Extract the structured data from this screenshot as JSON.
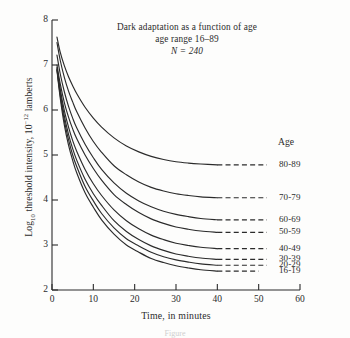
{
  "figure": {
    "background_color": "#fdfdfc",
    "ink_color": "#2b2b2b",
    "caption": "Figure"
  },
  "chart_data": {
    "type": "line",
    "title": "Dark adaptation as a function of age",
    "subtitle": "age range 16–89",
    "sample_note": "N = 240",
    "sample_size": 240,
    "xlabel": "Time, in minutes",
    "ylabel": "Log10 threshold intensity, 10-12 lamberts",
    "ylabel_parts": {
      "prefix": "Log",
      "sub": "10",
      "middle": " threshold intensity, 10",
      "sup": "−12",
      "suffix": " lamberts"
    },
    "xlim": [
      0,
      60
    ],
    "ylim": [
      2,
      8
    ],
    "xticks": [
      0,
      10,
      20,
      30,
      40,
      50,
      60
    ],
    "xtick_labels": [
      "0",
      "10",
      "20",
      "30",
      "40",
      "50",
      "60"
    ],
    "yticks": [
      2,
      3,
      4,
      5,
      6,
      7,
      8
    ],
    "ytick_labels": [
      "2",
      "3",
      "4",
      "5",
      "6",
      "7",
      "8"
    ],
    "grid": false,
    "legend_position": "right-inline",
    "legend_title": "Age",
    "series": [
      {
        "name": "80-89",
        "label": "80-89",
        "asymptote": 4.78,
        "start_value": 7.62,
        "x": [
          1.2,
          2,
          3,
          4,
          5,
          6,
          8,
          10,
          12,
          15,
          18,
          21,
          24,
          27,
          30,
          33,
          36,
          40
        ],
        "values": [
          7.62,
          7.28,
          6.98,
          6.74,
          6.54,
          6.36,
          6.06,
          5.82,
          5.62,
          5.38,
          5.2,
          5.07,
          4.97,
          4.9,
          4.85,
          4.82,
          4.8,
          4.78
        ],
        "dash_x": [
          40,
          52
        ],
        "dash_y": 4.78
      },
      {
        "name": "70-79",
        "label": "70-79",
        "asymptote": 4.05,
        "start_value": 7.5,
        "x": [
          1.2,
          2,
          3,
          4,
          5,
          6,
          8,
          10,
          12,
          15,
          18,
          21,
          24,
          27,
          30,
          33,
          36,
          40
        ],
        "values": [
          7.5,
          7.1,
          6.72,
          6.42,
          6.18,
          5.96,
          5.6,
          5.3,
          5.06,
          4.76,
          4.56,
          4.4,
          4.28,
          4.2,
          4.14,
          4.1,
          4.07,
          4.05
        ],
        "dash_x": [
          40,
          52
        ],
        "dash_y": 4.05
      },
      {
        "name": "60-69",
        "label": "60-69",
        "asymptote": 3.56,
        "start_value": 7.22,
        "x": [
          1.2,
          2,
          3,
          4,
          5,
          6,
          8,
          10,
          12,
          15,
          18,
          21,
          24,
          27,
          30,
          33,
          36,
          40
        ],
        "values": [
          7.22,
          6.8,
          6.4,
          6.08,
          5.82,
          5.6,
          5.24,
          4.94,
          4.68,
          4.38,
          4.15,
          3.98,
          3.85,
          3.75,
          3.68,
          3.63,
          3.59,
          3.56
        ],
        "dash_x": [
          40,
          52
        ],
        "dash_y": 3.56
      },
      {
        "name": "50-59",
        "label": "50-59",
        "asymptote": 3.28,
        "start_value": 7.0,
        "x": [
          1.2,
          2,
          3,
          4,
          5,
          6,
          8,
          10,
          12,
          15,
          18,
          21,
          24,
          27,
          30,
          33,
          36,
          40
        ],
        "values": [
          7.0,
          6.58,
          6.16,
          5.84,
          5.58,
          5.36,
          5.0,
          4.7,
          4.44,
          4.12,
          3.9,
          3.72,
          3.58,
          3.48,
          3.4,
          3.35,
          3.31,
          3.28
        ],
        "dash_x": [
          40,
          52
        ],
        "dash_y": 3.28
      },
      {
        "name": "40-49",
        "label": "40-49",
        "asymptote": 2.92,
        "start_value": 6.95,
        "x": [
          1.2,
          2,
          3,
          4,
          5,
          6,
          8,
          10,
          12,
          15,
          18,
          21,
          24,
          27,
          30,
          33,
          36,
          40
        ],
        "values": [
          6.95,
          6.46,
          5.98,
          5.62,
          5.32,
          5.08,
          4.68,
          4.36,
          4.1,
          3.78,
          3.54,
          3.36,
          3.22,
          3.12,
          3.04,
          2.99,
          2.95,
          2.92
        ],
        "dash_x": [
          40,
          52
        ],
        "dash_y": 2.92
      },
      {
        "name": "30-39",
        "label": "30-39",
        "asymptote": 2.68,
        "start_value": 6.92,
        "x": [
          1.2,
          2,
          3,
          4,
          5,
          6,
          8,
          10,
          12,
          15,
          18,
          21,
          24,
          27,
          30,
          33,
          36,
          40
        ],
        "values": [
          6.92,
          6.38,
          5.86,
          5.46,
          5.14,
          4.88,
          4.46,
          4.14,
          3.88,
          3.54,
          3.3,
          3.12,
          2.98,
          2.88,
          2.8,
          2.75,
          2.71,
          2.68
        ],
        "dash_x": [
          40,
          52
        ],
        "dash_y": 2.68
      },
      {
        "name": "20-29",
        "label": "20-29",
        "asymptote": 2.55,
        "start_value": 6.9,
        "x": [
          1.2,
          2,
          3,
          4,
          5,
          6,
          8,
          10,
          12,
          15,
          18,
          21,
          24,
          27,
          30,
          33,
          36,
          40
        ],
        "values": [
          6.9,
          6.32,
          5.76,
          5.34,
          5.0,
          4.74,
          4.3,
          3.98,
          3.7,
          3.38,
          3.14,
          2.98,
          2.84,
          2.74,
          2.67,
          2.62,
          2.58,
          2.55
        ],
        "dash_x": [
          40,
          52
        ],
        "dash_y": 2.55
      },
      {
        "name": "16-19",
        "label": "16-19",
        "asymptote": 2.42,
        "start_value": 6.88,
        "x": [
          1.2,
          2,
          3,
          4,
          5,
          6,
          8,
          10,
          12,
          15,
          18,
          21,
          24,
          27,
          30,
          33,
          36,
          40
        ],
        "values": [
          6.88,
          6.26,
          5.66,
          5.22,
          4.88,
          4.6,
          4.16,
          3.84,
          3.56,
          3.24,
          3.0,
          2.84,
          2.7,
          2.61,
          2.54,
          2.49,
          2.45,
          2.42
        ],
        "dash_x": [
          40,
          50
        ],
        "dash_y": 2.42
      }
    ]
  }
}
